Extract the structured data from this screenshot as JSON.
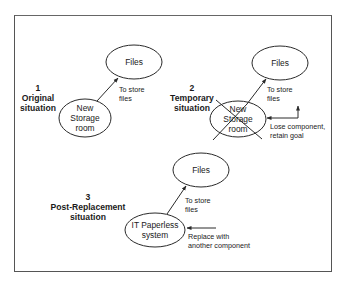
{
  "diagram": {
    "type": "component-replacement-diagram",
    "line_color": "#2a2a2a",
    "background": "#ffffff",
    "sections": [
      {
        "number": "1",
        "title_line1": "Original",
        "title_line2": "situation",
        "goal_node": {
          "label": "Files"
        },
        "component_node": {
          "line1": "New",
          "line2": "Storage",
          "line3": "room",
          "crossed_out": false
        },
        "edge_label_line1": "To store",
        "edge_label_line2": "files"
      },
      {
        "number": "2",
        "title_line1": "Temporary",
        "title_line2": "situation",
        "goal_node": {
          "label": "Files"
        },
        "component_node": {
          "line1": "New",
          "line2": "Storage",
          "line3": "room",
          "crossed_out": true
        },
        "edge_label_line1": "To store",
        "edge_label_line2": "files",
        "annotation_line1": "Lose component,",
        "annotation_line2": "retain goal"
      },
      {
        "number": "3",
        "title_line1": "Post-Replacement",
        "title_line2": "situation",
        "goal_node": {
          "label": "Files"
        },
        "component_node": {
          "line1": "IT Paperless",
          "line2": "system",
          "crossed_out": false
        },
        "edge_label_line1": "To store",
        "edge_label_line2": "files",
        "annotation_line1": "Replace with",
        "annotation_line2": "another component"
      }
    ]
  }
}
